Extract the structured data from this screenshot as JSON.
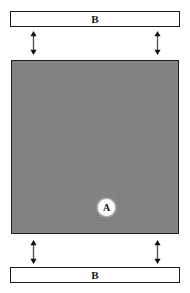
{
  "diagram": {
    "title": "",
    "background_color": "#ffffff",
    "block": {
      "label": "A",
      "fill_color": "#828282",
      "border_color": "#1f1f1f",
      "label_bubble_color": "#fdfdfd"
    },
    "plates": [
      {
        "label": "B",
        "position": "top",
        "fill_color": "#ffffff",
        "border_color": "#1a1a1a"
      },
      {
        "label": "B",
        "position": "bottom",
        "fill_color": "#ffffff",
        "border_color": "#1a1a1a"
      }
    ],
    "gap_arrows": [
      {
        "name": "top-left-gap-arrow",
        "label": "",
        "direction": "double-vertical",
        "color": "#111111"
      },
      {
        "name": "top-right-gap-arrow",
        "label": "",
        "direction": "double-vertical",
        "color": "#111111"
      },
      {
        "name": "bottom-left-gap-arrow",
        "label": "",
        "direction": "double-vertical",
        "color": "#111111"
      },
      {
        "name": "bottom-right-gap-arrow",
        "label": "",
        "direction": "double-vertical",
        "color": "#111111"
      }
    ]
  }
}
